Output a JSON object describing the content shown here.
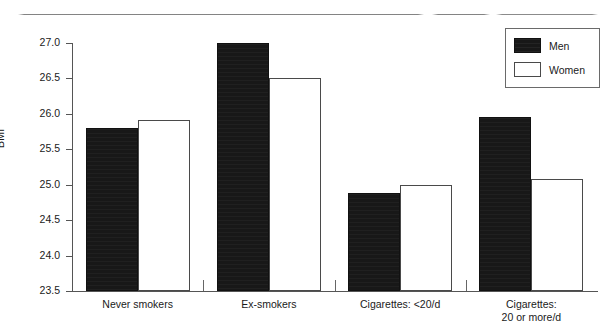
{
  "figure": {
    "top_rule": "horizontal-rule"
  },
  "chart_data": {
    "type": "bar",
    "title": "",
    "xlabel": "",
    "ylabel": "BMI",
    "ylim": [
      23.5,
      27.0
    ],
    "ytick_step": 0.5,
    "ytick_labels": [
      "27.0",
      "26.5",
      "26.0",
      "25.5",
      "25.0",
      "24.5",
      "24.0",
      "23.5"
    ],
    "ytick_values": [
      27.0,
      26.5,
      26.0,
      25.5,
      25.0,
      24.5,
      24.0,
      23.5
    ],
    "grid": false,
    "legend_position": "top-right",
    "categories": [
      "Never smokers",
      "Ex-smokers",
      "Cigarettes: <20/d",
      "Cigarettes:\n20 or more/d"
    ],
    "category_lines": [
      [
        "Never smokers"
      ],
      [
        "Ex-smokers"
      ],
      [
        "Cigarettes: <20/d"
      ],
      [
        "Cigarettes:",
        "20 or more/d"
      ]
    ],
    "series": [
      {
        "name": "Men",
        "color": "#181818",
        "fill": "solid-black",
        "values": [
          25.8,
          27.0,
          24.88,
          25.95
        ]
      },
      {
        "name": "Women",
        "color": "#ffffff",
        "fill": "open-outline",
        "values": [
          25.92,
          26.5,
          25.0,
          25.08
        ]
      }
    ]
  },
  "legend": {
    "entries": [
      {
        "label": "Men",
        "swatch": "filled-black-swatch"
      },
      {
        "label": "Women",
        "swatch": "open-white-swatch"
      }
    ]
  }
}
